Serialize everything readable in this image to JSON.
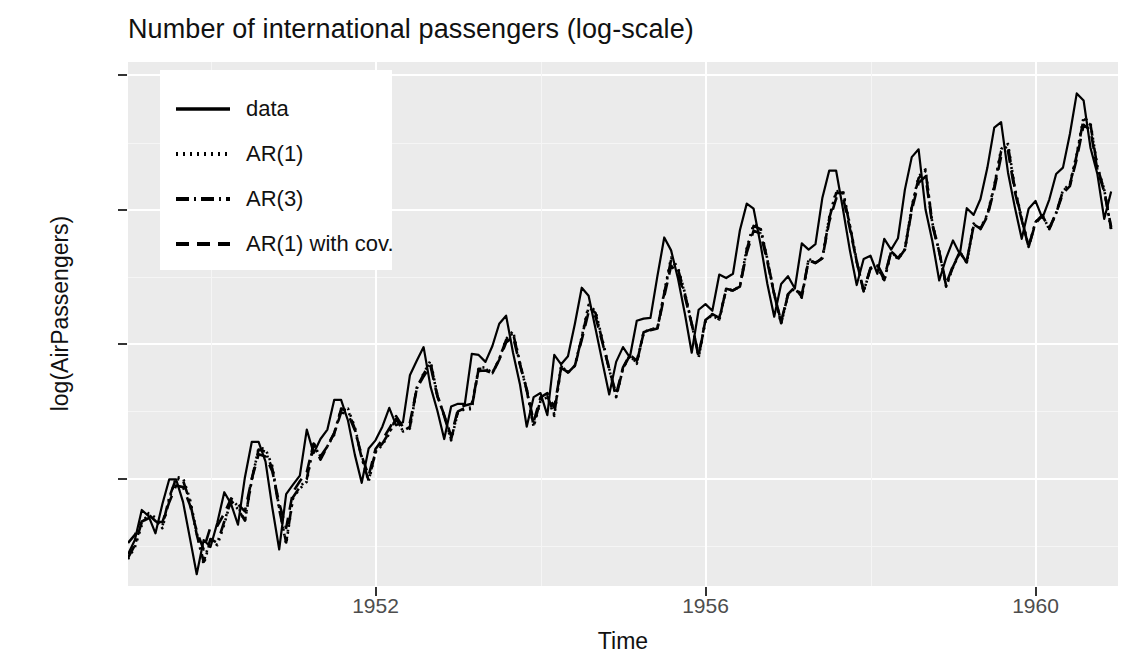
{
  "chart_data": {
    "type": "line",
    "title": "Number of international passengers (log-scale)",
    "xlabel": "Time",
    "ylabel": "log(AirPassengers)",
    "xlim": [
      1949.0,
      1961.0
    ],
    "ylim": [
      4.6,
      6.55
    ],
    "xticks": [
      1952,
      1956,
      1960
    ],
    "xtick_labels": [
      "1952",
      "1956",
      "1960"
    ],
    "yticks": [
      5.0,
      5.5,
      6.0,
      6.5
    ],
    "ytick_labels": [
      "5.0",
      "5.5",
      "6.0",
      "6.5"
    ],
    "grid": true,
    "legend_position": "top-left",
    "panel_background": "#ebebeb",
    "grid_color": "#ffffff",
    "line_color": "#000000",
    "x": [
      1949.0,
      1949.083,
      1949.167,
      1949.25,
      1949.333,
      1949.417,
      1949.5,
      1949.583,
      1949.667,
      1949.75,
      1949.833,
      1949.917,
      1950.0,
      1950.083,
      1950.167,
      1950.25,
      1950.333,
      1950.417,
      1950.5,
      1950.583,
      1950.667,
      1950.75,
      1950.833,
      1950.917,
      1951.0,
      1951.083,
      1951.167,
      1951.25,
      1951.333,
      1951.417,
      1951.5,
      1951.583,
      1951.667,
      1951.75,
      1951.833,
      1951.917,
      1952.0,
      1952.083,
      1952.167,
      1952.25,
      1952.333,
      1952.417,
      1952.5,
      1952.583,
      1952.667,
      1952.75,
      1952.833,
      1952.917,
      1953.0,
      1953.083,
      1953.167,
      1953.25,
      1953.333,
      1953.417,
      1953.5,
      1953.583,
      1953.667,
      1953.75,
      1953.833,
      1953.917,
      1954.0,
      1954.083,
      1954.167,
      1954.25,
      1954.333,
      1954.417,
      1954.5,
      1954.583,
      1954.667,
      1954.75,
      1954.833,
      1954.917,
      1955.0,
      1955.083,
      1955.167,
      1955.25,
      1955.333,
      1955.417,
      1955.5,
      1955.583,
      1955.667,
      1955.75,
      1955.833,
      1955.917,
      1956.0,
      1956.083,
      1956.167,
      1956.25,
      1956.333,
      1956.417,
      1956.5,
      1956.583,
      1956.667,
      1956.75,
      1956.833,
      1956.917,
      1957.0,
      1957.083,
      1957.167,
      1957.25,
      1957.333,
      1957.417,
      1957.5,
      1957.583,
      1957.667,
      1957.75,
      1957.833,
      1957.917,
      1958.0,
      1958.083,
      1958.167,
      1958.25,
      1958.333,
      1958.417,
      1958.5,
      1958.583,
      1958.667,
      1958.75,
      1958.833,
      1958.917,
      1959.0,
      1959.083,
      1959.167,
      1959.25,
      1959.333,
      1959.417,
      1959.5,
      1959.583,
      1959.667,
      1959.75,
      1959.833,
      1959.917,
      1960.0,
      1960.083,
      1960.167,
      1960.25,
      1960.333,
      1960.417,
      1960.5,
      1960.583,
      1960.667,
      1960.75,
      1960.833,
      1960.917
    ],
    "series": [
      {
        "name": "data",
        "linestyle": "solid",
        "values": [
          4.718,
          4.771,
          4.883,
          4.86,
          4.796,
          4.905,
          4.997,
          4.997,
          4.913,
          4.779,
          4.644,
          4.771,
          4.745,
          4.836,
          4.949,
          4.905,
          4.828,
          5.004,
          5.136,
          5.136,
          5.063,
          4.89,
          4.736,
          4.942,
          4.977,
          5.011,
          5.182,
          5.094,
          5.147,
          5.182,
          5.293,
          5.293,
          5.215,
          5.088,
          4.984,
          5.112,
          5.142,
          5.193,
          5.263,
          5.198,
          5.209,
          5.384,
          5.438,
          5.489,
          5.342,
          5.252,
          5.147,
          5.268,
          5.278,
          5.278,
          5.464,
          5.46,
          5.434,
          5.493,
          5.576,
          5.606,
          5.468,
          5.352,
          5.193,
          5.303,
          5.318,
          5.236,
          5.46,
          5.425,
          5.455,
          5.576,
          5.71,
          5.68,
          5.557,
          5.434,
          5.313,
          5.434,
          5.489,
          5.451,
          5.587,
          5.595,
          5.598,
          5.753,
          5.897,
          5.849,
          5.743,
          5.613,
          5.468,
          5.628,
          5.649,
          5.624,
          5.759,
          5.746,
          5.762,
          5.924,
          6.023,
          6.004,
          5.872,
          5.724,
          5.602,
          5.724,
          5.753,
          5.707,
          5.875,
          5.852,
          5.872,
          6.045,
          6.146,
          6.146,
          6.001,
          5.849,
          5.72,
          5.817,
          5.829,
          5.762,
          5.892,
          5.852,
          5.894,
          6.075,
          6.196,
          6.225,
          6.001,
          5.883,
          5.737,
          5.82,
          5.886,
          5.835,
          6.006,
          5.981,
          6.04,
          6.157,
          6.306,
          6.326,
          6.138,
          6.009,
          5.892,
          6.004,
          6.033,
          5.969,
          6.038,
          6.133,
          6.157,
          6.282,
          6.433,
          6.407,
          6.23,
          6.133,
          5.966,
          6.068
        ]
      },
      {
        "name": "AR(1)",
        "linestyle": "dotted",
        "values": [
          4.7,
          4.744,
          4.826,
          4.871,
          4.855,
          4.815,
          4.921,
          5.005,
          5.002,
          4.925,
          4.799,
          4.68,
          4.77,
          4.752,
          4.829,
          4.923,
          4.897,
          4.841,
          4.993,
          5.114,
          5.11,
          5.046,
          4.891,
          4.756,
          4.927,
          4.962,
          4.988,
          5.133,
          5.075,
          5.121,
          5.163,
          5.26,
          5.26,
          5.191,
          5.079,
          4.989,
          5.096,
          5.125,
          5.167,
          5.226,
          5.175,
          5.186,
          5.334,
          5.392,
          5.438,
          5.311,
          5.233,
          5.142,
          5.247,
          5.258,
          5.258,
          5.414,
          5.413,
          5.393,
          5.444,
          5.519,
          5.549,
          5.432,
          5.331,
          5.192,
          5.288,
          5.303,
          5.233,
          5.42,
          5.394,
          5.42,
          5.527,
          5.646,
          5.623,
          5.517,
          5.409,
          5.303,
          5.409,
          5.458,
          5.427,
          5.545,
          5.556,
          5.559,
          5.694,
          5.822,
          5.784,
          5.691,
          5.577,
          5.45,
          5.588,
          5.608,
          5.588,
          5.707,
          5.7,
          5.715,
          5.857,
          5.947,
          5.933,
          5.816,
          5.686,
          5.576,
          5.683,
          5.709,
          5.673,
          5.818,
          5.803,
          5.822,
          5.973,
          6.069,
          6.07,
          5.944,
          5.81,
          5.695,
          5.781,
          5.791,
          5.734,
          5.846,
          5.815,
          5.853,
          6.012,
          6.124,
          6.15,
          5.95,
          5.846,
          5.714,
          5.786,
          5.842,
          5.802,
          5.949,
          5.932,
          5.984,
          6.09,
          6.226,
          6.245,
          6.08,
          5.969,
          5.862,
          5.955,
          5.98,
          5.927,
          5.988,
          6.073,
          6.096,
          6.208,
          6.345,
          6.322,
          6.161,
          6.076,
          5.926
        ]
      },
      {
        "name": "AR(3)",
        "linestyle": "dashdot",
        "values": [
          4.705,
          4.752,
          4.838,
          4.866,
          4.842,
          4.822,
          4.93,
          5.0,
          4.993,
          4.915,
          4.792,
          4.69,
          4.775,
          4.76,
          4.84,
          4.918,
          4.886,
          4.843,
          4.998,
          5.108,
          5.1,
          5.036,
          4.885,
          4.762,
          4.93,
          4.968,
          4.998,
          5.128,
          5.07,
          5.12,
          5.17,
          5.258,
          5.253,
          5.184,
          5.076,
          4.992,
          5.1,
          5.13,
          5.172,
          5.222,
          5.176,
          5.192,
          5.338,
          5.388,
          5.432,
          5.308,
          5.232,
          5.146,
          5.25,
          5.262,
          5.264,
          5.408,
          5.408,
          5.392,
          5.444,
          5.516,
          5.542,
          5.428,
          5.328,
          5.196,
          5.292,
          5.306,
          5.24,
          5.418,
          5.394,
          5.42,
          5.524,
          5.638,
          5.616,
          5.512,
          5.406,
          5.304,
          5.41,
          5.458,
          5.43,
          5.544,
          5.554,
          5.558,
          5.69,
          5.814,
          5.778,
          5.688,
          5.576,
          5.452,
          5.59,
          5.61,
          5.592,
          5.706,
          5.7,
          5.714,
          5.852,
          5.94,
          5.928,
          5.814,
          5.686,
          5.578,
          5.684,
          5.71,
          5.676,
          5.816,
          5.802,
          5.82,
          5.968,
          6.062,
          6.064,
          5.94,
          5.808,
          5.696,
          5.782,
          5.792,
          5.738,
          5.846,
          5.816,
          5.852,
          6.008,
          6.118,
          6.144,
          5.948,
          5.844,
          5.716,
          5.788,
          5.842,
          5.804,
          5.946,
          5.93,
          5.98,
          6.086,
          6.218,
          6.238,
          6.076,
          5.966,
          5.862,
          5.954,
          5.98,
          5.928,
          5.988,
          6.07,
          6.094,
          6.204,
          6.338,
          6.316,
          6.158,
          6.074,
          5.928
        ]
      },
      {
        "name": "AR(1) with cov.",
        "linestyle": "dashed",
        "values": [
          4.76,
          4.79,
          4.84,
          4.852,
          4.838,
          4.838,
          4.912,
          4.974,
          4.968,
          4.902,
          4.804,
          4.736,
          4.82,
          4.824,
          4.87,
          4.926,
          4.904,
          4.878,
          4.998,
          5.09,
          5.082,
          5.026,
          4.908,
          4.816,
          4.95,
          4.99,
          5.024,
          5.13,
          5.082,
          5.12,
          5.168,
          5.246,
          5.24,
          5.18,
          5.084,
          5.01,
          5.11,
          5.144,
          5.186,
          5.232,
          5.192,
          5.208,
          5.334,
          5.38,
          5.418,
          5.306,
          5.236,
          5.158,
          5.258,
          5.272,
          5.278,
          5.4,
          5.402,
          5.392,
          5.442,
          5.506,
          5.528,
          5.424,
          5.332,
          5.212,
          5.302,
          5.318,
          5.264,
          5.412,
          5.396,
          5.42,
          5.516,
          5.62,
          5.602,
          5.506,
          5.408,
          5.314,
          5.414,
          5.46,
          5.438,
          5.54,
          5.552,
          5.558,
          5.678,
          5.792,
          5.762,
          5.678,
          5.574,
          5.46,
          5.59,
          5.612,
          5.598,
          5.702,
          5.7,
          5.714,
          5.84,
          5.922,
          5.912,
          5.806,
          5.686,
          5.584,
          5.686,
          5.712,
          5.684,
          5.812,
          5.802,
          5.82,
          5.956,
          6.042,
          6.046,
          5.93,
          5.806,
          5.7,
          5.784,
          5.796,
          5.748,
          5.846,
          5.82,
          5.854,
          5.998,
          6.1,
          6.124,
          5.942,
          5.844,
          5.724,
          5.792,
          5.842,
          5.81,
          5.94,
          5.928,
          5.976,
          6.076,
          6.198,
          6.218,
          6.066,
          5.962,
          5.862,
          5.95,
          5.978,
          5.932,
          5.988,
          6.062,
          6.088,
          6.19,
          6.316,
          6.296,
          6.148,
          6.068,
          5.936
        ]
      }
    ]
  }
}
